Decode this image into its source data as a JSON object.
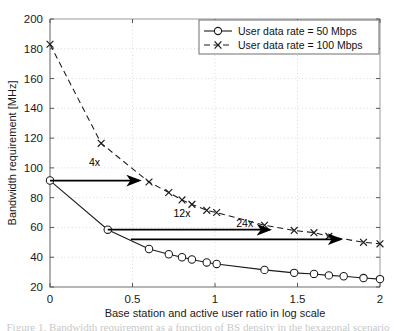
{
  "chart_data": {
    "type": "line",
    "title": "",
    "xlabel": "Base station and active user ratio in log scale",
    "ylabel": "Bandwidth requirement [MHz]",
    "xlim": [
      0,
      2
    ],
    "ylim": [
      20,
      200
    ],
    "xticks": [
      0,
      0.5,
      1,
      1.5,
      2
    ],
    "xtick_labels": [
      "0",
      "0.5",
      "1",
      "1.5",
      "2"
    ],
    "yticks": [
      20,
      40,
      60,
      80,
      100,
      120,
      140,
      160,
      180,
      200
    ],
    "ytick_labels": [
      "20",
      "40",
      "60",
      "80",
      "100",
      "120",
      "140",
      "160",
      "180",
      "200"
    ],
    "grid": true,
    "legend_position": "top-right",
    "series": [
      {
        "name": "User data rate = 50 Mbps",
        "marker": "circle",
        "linestyle": "solid",
        "color": "#1a1a1a",
        "x": [
          0,
          0.35,
          0.6,
          0.72,
          0.8,
          0.86,
          0.95,
          1.01,
          1.3,
          1.48,
          1.6,
          1.69,
          1.78,
          1.9,
          2.0
        ],
        "y": [
          91.5,
          58.5,
          45.5,
          42.0,
          40.0,
          38.5,
          36.5,
          35.5,
          31.5,
          29.5,
          28.8,
          27.8,
          27.2,
          26.0,
          25.3
        ]
      },
      {
        "name": "User data rate = 100 Mbps",
        "marker": "x",
        "linestyle": "dashed",
        "color": "#1a1a1a",
        "x": [
          0,
          0.31,
          0.6,
          0.72,
          0.8,
          0.86,
          0.95,
          1.01,
          1.3,
          1.48,
          1.6,
          1.69,
          1.9,
          2.0
        ],
        "y": [
          183.0,
          116.5,
          90.5,
          83.5,
          78.5,
          75.5,
          71.5,
          70.0,
          61.5,
          58.0,
          56.5,
          54.0,
          50.0,
          49.0
        ]
      }
    ],
    "annotations": [
      {
        "label": "4x",
        "y": 91.5,
        "x_start": 0.0,
        "x_end": 0.54,
        "label_x": 0.27,
        "label_y": 101
      },
      {
        "label": "12x",
        "y": 58.5,
        "x_start": 0.35,
        "x_end": 1.33,
        "label_x": 0.8,
        "label_y": 67
      },
      {
        "label": "24x",
        "y": 52.0,
        "x_start": 0.49,
        "x_end": 1.76,
        "label_x": 1.18,
        "label_y": 60
      }
    ]
  },
  "legend": {
    "entries": [
      {
        "label": "User data rate = 50 Mbps",
        "marker": "circle",
        "linestyle": "solid"
      },
      {
        "label": "User data rate = 100 Mbps",
        "marker": "x",
        "linestyle": "dashed"
      }
    ]
  },
  "caption_partial": "Figure 1. Bandwidth requirement as a function of BS density in the hexagonal scenario"
}
